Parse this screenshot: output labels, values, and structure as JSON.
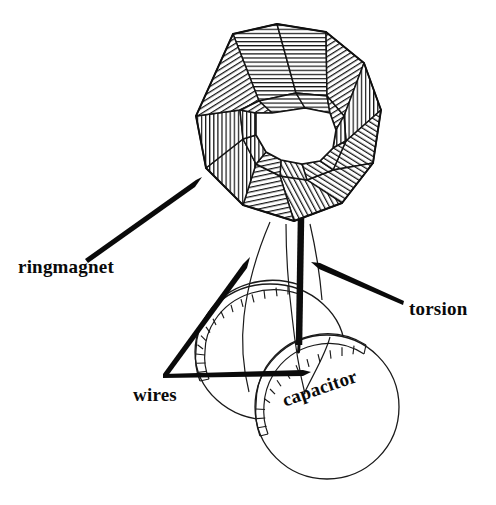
{
  "figure": {
    "background_color": "#ffffff",
    "ink_color": "#0a0a0a",
    "line_color": "#111111",
    "width": 496,
    "height": 505
  },
  "labels": {
    "ringmagnet": "ringmagnet",
    "wires": "wires",
    "torsion": "torsion",
    "capacitor": "capacitor"
  },
  "parts": {
    "ring_magnet": {
      "name": "ringmagnet",
      "shape": "faceted torus",
      "facet_count": 10,
      "center_x": 287,
      "center_y": 133,
      "outer_radius_x": 103,
      "outer_radius_y": 110,
      "inner_radius_x": 45,
      "inner_radius_y": 44
    },
    "torsion_rod": {
      "name": "torsion",
      "shape": "vertical rod",
      "top_x": 301,
      "top_y": 219,
      "bottom_x": 299,
      "bottom_y": 345,
      "thickness": 6
    },
    "wires": {
      "name": "wires",
      "count": 2,
      "shape": "curved filaments"
    },
    "capacitor": {
      "name": "capacitor",
      "plate_count": 2,
      "plates": [
        {
          "cx": 270,
          "cy": 352,
          "rx": 75,
          "ry": 68
        },
        {
          "cx": 327,
          "cy": 407,
          "rx": 72,
          "ry": 72
        }
      ]
    }
  },
  "arrows": [
    {
      "name": "ringmagnet-arrow",
      "from_x": 85,
      "from_y": 259,
      "to_x": 202,
      "to_y": 177
    },
    {
      "name": "wires-arrow-upper",
      "from_x": 163,
      "from_y": 374,
      "to_x": 250,
      "to_y": 257
    },
    {
      "name": "wires-arrow-lower",
      "from_x": 163,
      "from_y": 374,
      "to_x": 311,
      "to_y": 372
    },
    {
      "name": "torsion-arrow",
      "from_x": 404,
      "from_y": 300,
      "to_x": 311,
      "to_y": 262
    },
    {
      "name": "capacitor-leader",
      "from_x": 330,
      "from_y": 337,
      "to_x": 303,
      "to_y": 395
    }
  ]
}
